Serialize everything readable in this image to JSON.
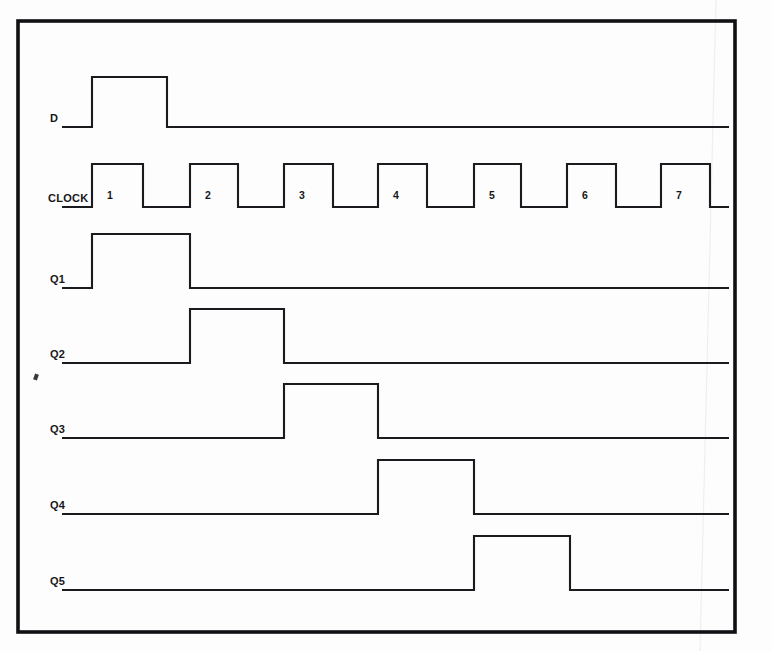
{
  "figure": {
    "kind": "digital-timing-diagram",
    "background_color": "#fdfdfd",
    "line_color": "#1b1b1f",
    "frame_color": "#111115"
  },
  "frame": {
    "x": 18,
    "y": 21,
    "width": 717,
    "height": 611
  },
  "timing": {
    "trace_start_x": 62,
    "trace_end_x": 729,
    "clock_period_px": 95.6,
    "clock_first_rise_x": 92,
    "clock_duty": 0.5,
    "clock_high_px": 49,
    "amplitude_px": 34,
    "clock_amplitude_px": 30
  },
  "clock_numbers": [
    "1",
    "2",
    "3",
    "4",
    "5",
    "6",
    "7"
  ],
  "signals": [
    {
      "name": "D",
      "label": "D",
      "baseline_y": 127,
      "amplitude": 50,
      "label_x": 50,
      "label_y": 122,
      "transitions": [
        {
          "x": 92,
          "level": 1
        },
        {
          "x": 167,
          "level": 0
        }
      ]
    },
    {
      "name": "CLOCK",
      "label": "CLOCK",
      "baseline_y": 207,
      "amplitude": 43,
      "label_x": 48,
      "label_y": 202,
      "pulses": [
        {
          "number": "1",
          "rise_x": 92,
          "fall_x": 143
        },
        {
          "number": "2",
          "rise_x": 190,
          "fall_x": 238
        },
        {
          "number": "3",
          "rise_x": 284,
          "fall_x": 333
        },
        {
          "number": "4",
          "rise_x": 378,
          "fall_x": 427
        },
        {
          "number": "5",
          "rise_x": 474,
          "fall_x": 521
        },
        {
          "number": "6",
          "rise_x": 567,
          "fall_x": 616
        },
        {
          "number": "7",
          "rise_x": 661,
          "fall_x": 710
        }
      ]
    },
    {
      "name": "Q1",
      "label": "Q1",
      "baseline_y": 288,
      "amplitude": 54,
      "label_x": 50,
      "label_y": 283,
      "transitions": [
        {
          "x": 92,
          "level": 1
        },
        {
          "x": 190,
          "level": 0
        }
      ]
    },
    {
      "name": "Q2",
      "label": "Q2",
      "baseline_y": 363,
      "amplitude": 54,
      "label_x": 50,
      "label_y": 358,
      "transitions": [
        {
          "x": 190,
          "level": 1
        },
        {
          "x": 284,
          "level": 0
        }
      ]
    },
    {
      "name": "Q3",
      "label": "Q3",
      "baseline_y": 438,
      "amplitude": 54,
      "label_x": 50,
      "label_y": 433,
      "transitions": [
        {
          "x": 284,
          "level": 1
        },
        {
          "x": 378,
          "level": 0
        }
      ]
    },
    {
      "name": "Q4",
      "label": "Q4",
      "baseline_y": 514,
      "amplitude": 54,
      "label_x": 50,
      "label_y": 509,
      "transitions": [
        {
          "x": 378,
          "level": 1
        },
        {
          "x": 474,
          "level": 0
        }
      ]
    },
    {
      "name": "Q5",
      "label": "Q5",
      "baseline_y": 590,
      "amplitude": 54,
      "label_x": 50,
      "label_y": 585,
      "transitions": [
        {
          "x": 474,
          "level": 1
        },
        {
          "x": 570,
          "level": 0
        }
      ]
    }
  ],
  "artifacts": {
    "speck": {
      "x": 34,
      "y": 374,
      "w": 4,
      "h": 6
    },
    "scan_line_x_top": 716,
    "scan_line_x_bottom": 700
  }
}
